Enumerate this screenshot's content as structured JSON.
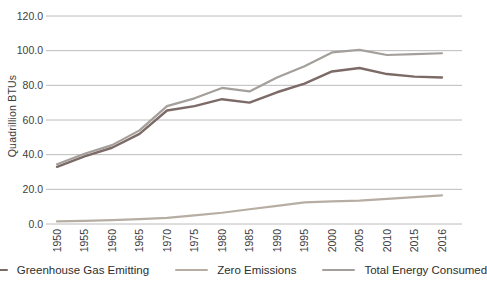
{
  "chart_data": {
    "type": "line",
    "title": "",
    "xlabel": "",
    "ylabel": "Quadrillion BTUs",
    "ylim": [
      0,
      120
    ],
    "ytick_step": 20,
    "yticks": [
      "0.0",
      "20.0",
      "40.0",
      "60.0",
      "80.0",
      "100.0",
      "120.0"
    ],
    "grid": "horizontal",
    "legend_position": "bottom",
    "categories": [
      "1950",
      "1955",
      "1960",
      "1965",
      "1970",
      "1975",
      "1980",
      "1985",
      "1990",
      "1995",
      "2000",
      "2005",
      "2010",
      "2015",
      "2016"
    ],
    "series": [
      {
        "name": "Greenhouse Gas Emitting",
        "color": "#7c6a67",
        "line_width": 2.4,
        "values": [
          33,
          39,
          44,
          52,
          65.5,
          68,
          72,
          70,
          76,
          81,
          88,
          90,
          86.5,
          85,
          84.5
        ]
      },
      {
        "name": "Zero Emissions",
        "color": "#b7aea3",
        "line_width": 2.2,
        "values": [
          1.5,
          1.8,
          2.2,
          2.8,
          3.5,
          5,
          6.5,
          8.5,
          10.5,
          12.5,
          13,
          13.5,
          14.5,
          15.5,
          16.5
        ]
      },
      {
        "name": "Total Energy Consumed",
        "color": "#a49f9a",
        "line_width": 2.2,
        "values": [
          34.5,
          40.5,
          45.5,
          54,
          68,
          72.5,
          78.5,
          76.5,
          84.5,
          91,
          99,
          100.5,
          97.5,
          98,
          98.5
        ]
      }
    ],
    "colors": {
      "gridline": "#bcbcbc",
      "tick_text": "#3d3d3d",
      "legend_text": "#2e2e2e"
    }
  }
}
